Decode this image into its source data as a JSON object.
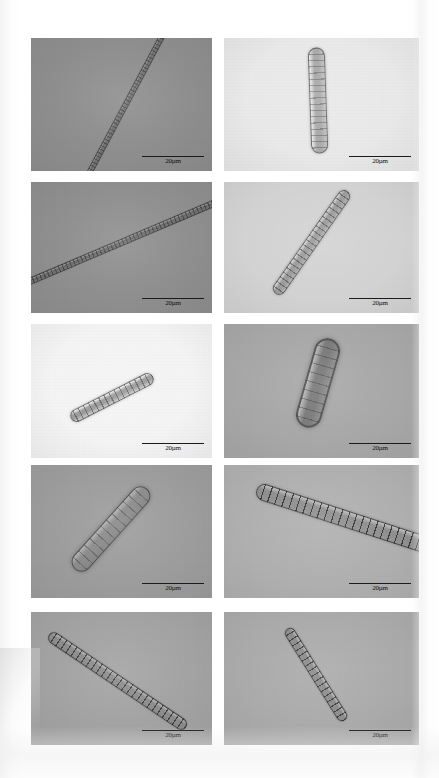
{
  "figure": {
    "type": "photomicrograph-plate",
    "rows": 5,
    "columns": 2,
    "page_background": "#ffffff"
  },
  "scalebar": {
    "label": "20µm",
    "line_color": "#1b1b1b",
    "text_color": "#121212"
  },
  "panels": [
    {
      "id": "panel-1",
      "row": 1,
      "column": 1,
      "x": 31,
      "y": 38,
      "width": 181,
      "height": 133,
      "background": "#8e8e8e",
      "scale_label": "20µm",
      "organism": {
        "shape": "long-slender-filament",
        "cx": 52,
        "cy": 50,
        "length": 175,
        "thickness": 6,
        "angle": 62,
        "body_color": "#6e6e6e",
        "wall_color": "#4c4c4c",
        "septa_count": 46,
        "septa_color": "rgba(55,55,55,0.55)"
      }
    },
    {
      "id": "panel-2",
      "row": 1,
      "column": 2,
      "x": 224,
      "y": 38,
      "width": 195,
      "height": 133,
      "background": "#e9e9e9",
      "scale_label": "20µm",
      "organism": {
        "shape": "short-thick-filament",
        "cx": 48,
        "cy": 47,
        "length": 106,
        "thickness": 17,
        "angle": 92,
        "body_color": "#a9a9a9",
        "wall_color": "#6d6d6d",
        "septa_count": 16,
        "septa_color": "rgba(90,90,90,0.5)"
      }
    },
    {
      "id": "panel-3",
      "row": 2,
      "column": 1,
      "x": 31,
      "y": 182,
      "width": 181,
      "height": 131,
      "background": "#8f8f8f",
      "scale_label": "20µm",
      "organism": {
        "shape": "long-slender-filament",
        "cx": 50,
        "cy": 46,
        "length": 215,
        "thickness": 7,
        "angle": 23,
        "body_color": "#6b6b6b",
        "wall_color": "#474747",
        "septa_count": 52,
        "septa_color": "rgba(50,50,50,0.6)"
      }
    },
    {
      "id": "panel-4",
      "row": 2,
      "column": 2,
      "x": 224,
      "y": 182,
      "width": 195,
      "height": 131,
      "background": "#d3d3d3",
      "scale_label": "20µm",
      "organism": {
        "shape": "medium-filament",
        "cx": 45,
        "cy": 46,
        "length": 125,
        "thickness": 13,
        "angle": 55,
        "body_color": "#9b9b9b",
        "wall_color": "#6a6a6a",
        "septa_count": 21,
        "septa_color": "rgba(70,70,70,0.6)"
      }
    },
    {
      "id": "panel-5",
      "row": 3,
      "column": 1,
      "x": 31,
      "y": 324,
      "width": 181,
      "height": 134,
      "background": "#f4f4f4",
      "scale_label": "20µm",
      "organism": {
        "shape": "short-filament",
        "cx": 45,
        "cy": 55,
        "length": 92,
        "thickness": 13,
        "angle": 27,
        "body_color": "#9a9a9a",
        "wall_color": "#686868",
        "septa_count": 15,
        "septa_color": "rgba(70,70,70,0.62)"
      }
    },
    {
      "id": "panel-6",
      "row": 3,
      "column": 2,
      "x": 224,
      "y": 324,
      "width": 195,
      "height": 134,
      "background": "#a8a8a8",
      "scale_label": "20µm",
      "organism": {
        "shape": "stout-filament",
        "cx": 48,
        "cy": 44,
        "length": 92,
        "thickness": 26,
        "angle": 74,
        "body_color": "#787878",
        "wall_color": "#535353",
        "septa_count": 9,
        "septa_color": "rgba(60,60,60,0.45)"
      }
    },
    {
      "id": "panel-7",
      "row": 4,
      "column": 1,
      "x": 31,
      "y": 465,
      "width": 181,
      "height": 133,
      "background": "#9d9d9d",
      "scale_label": "20µm",
      "organism": {
        "shape": "thick-filament",
        "cx": 44,
        "cy": 48,
        "length": 108,
        "thickness": 20,
        "angle": 48,
        "body_color": "#8a8a8a",
        "wall_color": "#4e4e4e",
        "septa_count": 12,
        "septa_color": "rgba(70,70,70,0.5)"
      }
    },
    {
      "id": "panel-8",
      "row": 4,
      "column": 2,
      "x": 224,
      "y": 465,
      "width": 195,
      "height": 133,
      "background": "#b0b0b0",
      "scale_label": "20µm",
      "organism": {
        "shape": "banded-filament-apex",
        "cx": 62,
        "cy": 40,
        "length": 185,
        "thickness": 17,
        "angle": -18,
        "body_color": "#8f8f8f",
        "wall_color": "#4a4a4a",
        "septa_count": 24,
        "septa_color": "rgba(30,30,30,0.78)"
      }
    },
    {
      "id": "panel-9",
      "row": 5,
      "column": 1,
      "x": 31,
      "y": 612,
      "width": 181,
      "height": 133,
      "background": "#a3a3a3",
      "scale_label": "20µm",
      "organism": {
        "shape": "banded-filament",
        "cx": 48,
        "cy": 52,
        "length": 165,
        "thickness": 12,
        "angle": -34,
        "body_color": "#8c8c8c",
        "wall_color": "#4a4a4a",
        "septa_count": 26,
        "septa_color": "rgba(35,35,35,0.72)"
      }
    },
    {
      "id": "panel-10",
      "row": 5,
      "column": 2,
      "x": 224,
      "y": 612,
      "width": 195,
      "height": 133,
      "background": "#ababab",
      "scale_label": "20µm",
      "organism": {
        "shape": "banded-filament",
        "cx": 47,
        "cy": 47,
        "length": 108,
        "thickness": 11,
        "angle": -58,
        "body_color": "#8b8b8b",
        "wall_color": "#4b4b4b",
        "septa_count": 17,
        "septa_color": "rgba(35,35,35,0.72)"
      }
    }
  ]
}
